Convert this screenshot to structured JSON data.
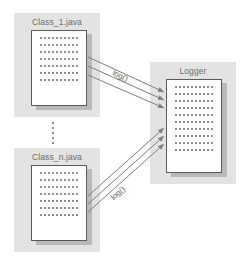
{
  "diagram": {
    "background_color": "#ffffff",
    "panel_color": "#e3e3e3",
    "document_color": "#ffffff",
    "document_border_color": "#58595b",
    "shadow_color": "#b9b9b9",
    "arrow_color": "#7d7d7d",
    "text_color": "#6d6d6d"
  },
  "nodes": [
    {
      "id": "class-1",
      "label": "Class_1.java",
      "kind": "source-file",
      "text_rows": 7
    },
    {
      "id": "class-n",
      "label": "Class_n.java",
      "kind": "source-file",
      "text_rows": 7
    },
    {
      "id": "logger",
      "label": "Logger",
      "kind": "logger-component",
      "text_rows": 10
    }
  ],
  "ellipsis": {
    "name": "vertical-ellipsis",
    "meaning": "additional classes omitted"
  },
  "edges": [
    {
      "id": "edge-class1-logger",
      "from": "class-1",
      "to": "logger",
      "label": "log()",
      "arrow_count": 3
    },
    {
      "id": "edge-classn-logger",
      "from": "class-n",
      "to": "logger",
      "label": "log()",
      "arrow_count": 3
    }
  ]
}
